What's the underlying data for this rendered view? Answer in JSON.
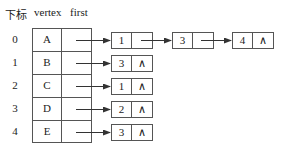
{
  "header": {
    "index_label": "下标",
    "vertex_label": "vertex",
    "first_label": "first"
  },
  "rows": [
    {
      "index": "0",
      "vertex": "A",
      "nodes": [
        {
          "adjvex": "1",
          "next": "→"
        },
        {
          "adjvex": "3",
          "next": "→"
        },
        {
          "adjvex": "4",
          "next": "∧"
        }
      ]
    },
    {
      "index": "1",
      "vertex": "B",
      "nodes": [
        {
          "adjvex": "3",
          "next": "∧"
        }
      ]
    },
    {
      "index": "2",
      "vertex": "C",
      "nodes": [
        {
          "adjvex": "1",
          "next": "∧"
        }
      ]
    },
    {
      "index": "3",
      "vertex": "D",
      "nodes": [
        {
          "adjvex": "2",
          "next": "∧"
        }
      ]
    },
    {
      "index": "4",
      "vertex": "E",
      "nodes": [
        {
          "adjvex": "3",
          "next": "∧"
        }
      ]
    }
  ],
  "colors": {
    "line": "#555555",
    "text": "#222222"
  }
}
